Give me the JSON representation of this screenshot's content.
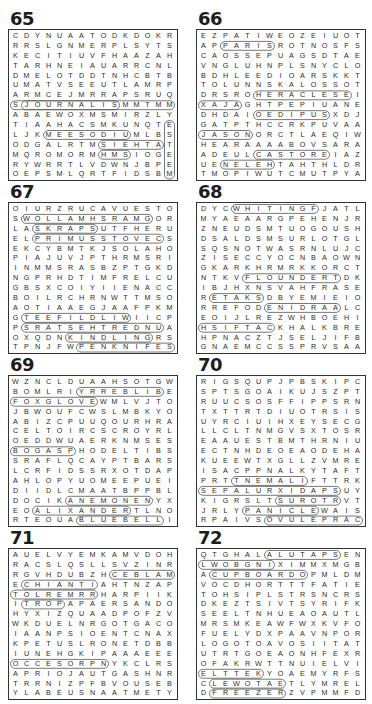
{
  "puzzles": [
    {
      "number": "65",
      "rows": [
        "CDYNUAATODKDOKR",
        "RRSLGNMERPLSYTS",
        "KECITIUVFHAAZAH",
        "TARHNEIAUARRCNL",
        "DMELOTDDTNHCBTB",
        "UMATVSEEUTLAMRP",
        "ARMCEJMRRAPSRUQ",
        "SJOURNALISMMTMM",
        "ABAEWOXMSMIRZLY",
        "TIAAHACSMKUNQTE",
        "LJKMEESODIUMLBS",
        "ODGALRTMSIEHTAT",
        "MQROMORMHMSIOGE",
        "RYWRRTLVDWNJBPE",
        "OEPSMLQRTFIDSBM"
      ],
      "loops": [
        [
          1,
          7,
          9,
          7
        ],
        [
          3,
          10,
          10,
          10
        ],
        [
          8,
          11,
          13,
          11
        ],
        [
          8,
          12,
          10,
          12
        ],
        [
          14,
          9,
          14,
          14
        ],
        [
          0,
          7,
          14,
          7
        ]
      ]
    },
    {
      "number": "66",
      "rows": [
        "EZPATIWEOZEIUOT",
        "APPARISROTNOSFS",
        "CAOSSEPUAGSDTAE",
        "VNGLUHNPLSNYCLO",
        "BDHLEEDIOARSKKT",
        "TOLUNNSKALOSSOT",
        "DRSROHERACLESEI",
        "XAJAGHTPEPIUANE",
        "DHDAIOEDIPUSXDJ",
        "GATPTHCCRKPUVAA",
        "JASONORCTLAEQIW",
        "HEARAAAABOVSARA",
        "ADEULCASTOREIAZ",
        "UENELEHTAHTHLDR",
        "TMOPIWUTCMUTPYA"
      ],
      "loops": [
        [
          2,
          1,
          6,
          1
        ],
        [
          5,
          6,
          13,
          6
        ],
        [
          0,
          7,
          3,
          7
        ],
        [
          5,
          8,
          11,
          8
        ],
        [
          0,
          10,
          4,
          10
        ],
        [
          5,
          12,
          11,
          12
        ],
        [
          2,
          13,
          6,
          13
        ]
      ]
    },
    {
      "number": "67",
      "rows": [
        "OIURZRUCAVUESTO",
        "SWOLLAMHSRAMGOR",
        "LASKRAPSUTFHERU",
        "ELPRIMUSSTOVECS",
        "EKCYBMTKJSOLAHO",
        "PIAJUVJPTHRMSRI",
        "INMMSRASBZPTGKD",
        "NGPRHDTIMFRELCU",
        "GBSXCOIYIIENACC",
        "BOILRCHRNWTTMSO",
        "AOTIAAEGJAAFPKM",
        "GTEEFILDLIWIICP",
        "PSRATSEHTREDNUA",
        "OXQDNKINDLINGRS",
        "TPNJFWPENKNIFES"
      ],
      "loops": [
        [
          1,
          1,
          12,
          1
        ],
        [
          2,
          2,
          7,
          2
        ],
        [
          2,
          3,
          13,
          3
        ],
        [
          1,
          11,
          10,
          11
        ],
        [
          1,
          12,
          13,
          12
        ],
        [
          5,
          13,
          12,
          13
        ],
        [
          6,
          14,
          14,
          14
        ]
      ]
    },
    {
      "number": "68",
      "rows": [
        "DYCWHITINGFJATL",
        "MYAEAARGPEHENJR",
        "ZNEUDSMTUOGOUSH",
        "DSALDSMSURLOTGL",
        "SQSNOTWASRNLUJC",
        "ZISECCYOCNBAOWN",
        "GKARKHRMRKKORCT",
        "NTKVFLOUNDERTDK",
        "IBJHXNSVAHFRASE",
        "RETAKSDBYEMIEIO",
        "RREFODENIDRAALC",
        "EOIJLREZWHBOEHI",
        "HSIFTACKHALKBRE",
        "HPNACZTJSELJIFB",
        "GNAEMCCSSPRVSAA"
      ],
      "loops": [
        [
          3,
          0,
          10,
          0
        ],
        [
          4,
          7,
          12,
          7
        ],
        [
          1,
          9,
          5,
          9
        ],
        [
          6,
          10,
          12,
          10
        ],
        [
          0,
          12,
          6,
          12
        ]
      ]
    },
    {
      "number": "69",
      "rows": [
        "WZNCLDUAAHSOTGW",
        "BOMLRIYRREBLIBE",
        "FOXGLOVEWMLVJTO",
        "JBWOUFCWSLMBKYO",
        "ABIZCPUUQOURHRA",
        "CELTOIRCSCROYRL",
        "OEDDWUAERKNMSES",
        "BOGASPHODELTIBS",
        "SRAFLQCAYPTBARS",
        "LCRFIDSSRXOTDAP",
        "AHLOPYUOMEEPUEI",
        "DIIDLCMAATBPPBL",
        "DOCIKANEMONENYX",
        "EOALIXANDERTLNO",
        "RTEOUABLUEBELLI"
      ],
      "loops": [
        [
          6,
          1,
          13,
          1
        ],
        [
          0,
          2,
          7,
          2
        ],
        [
          0,
          7,
          5,
          7
        ],
        [
          5,
          12,
          12,
          12
        ],
        [
          2,
          13,
          10,
          13
        ],
        [
          6,
          14,
          13,
          14
        ]
      ]
    },
    {
      "number": "70",
      "rows": [
        "RIGSQUPJPBSKIPC",
        "SPTSGOAIKUJSZPT",
        "RUUCSOSFFIPPSRN",
        "TXTTRTDIUOTRSIS",
        "UYRCIUIHXEYSECG",
        "LLCLTNMGVSXTOSR",
        "EAAUESTBMTHRNIU",
        "ECTNHDEOEAODEHA",
        "KUEEWTXGLLZVMRE",
        "ISACPPNALKYTAFT",
        "PRTTNEMALIFTTRK",
        "SEPALURXIDAPSUY",
        "KIGRSLTSUROTRVT",
        "JRLYPANICLEWAIS",
        "RPAIVSOVULEPRAC"
      ],
      "loops": [
        [
          3,
          10,
          9,
          10
        ],
        [
          0,
          11,
          12,
          11
        ],
        [
          7,
          12,
          12,
          12
        ],
        [
          4,
          13,
          10,
          13
        ],
        [
          6,
          14,
          14,
          14
        ]
      ]
    },
    {
      "number": "71",
      "rows": [
        "AUELVYEMKAMVDOH",
        "RACSLQSLLSVZINR",
        "RGVHDUBZHCEBLAM",
        "ECHIANTIAHTNZAP",
        "TOLREMRRHARPIIK",
        "ITROPAPAERSANDO",
        "HYXIZQUAADPOFZV",
        "WKDUELNRGOTGACO",
        "IAANPSIOENTCNAX",
        "KPETUSLRONETDBB",
        "IUNEHGKIPAAAEEE",
        "OCCESORPNYKCLRS",
        "APRIOJAUTGASHNR",
        "TRRNIZPFBVOUSEB",
        "YLABEUSNAATMETY"
      ],
      "loops": [
        [
          9,
          2,
          14,
          2
        ],
        [
          1,
          3,
          7,
          3
        ],
        [
          0,
          4,
          7,
          4
        ],
        [
          1,
          5,
          4,
          5
        ],
        [
          0,
          11,
          8,
          11
        ]
      ]
    },
    {
      "number": "72",
      "rows": [
        "QTGHALALUTAPSEN",
        "LWOBGNIXIMMXMGB",
        "ACUPBOARDOPMLDM",
        "VOCDHORTTTFATIE",
        "TOHSIPLSTRSNCRS",
        "DKEZTSIVTSYRIFK",
        "SEELTNHUEAOAUTL",
        "MRSMKEAWFWXKVFO",
        "FUELYDXPAAVNPOR",
        "LOGOTOAVOSIITAT",
        "UTRTGOEAONHFEXR",
        "OFAKRWTTNUIELVI",
        "ELTTEKYOAEMYRFS",
        "CLEWOTAETLYMREL",
        "DFREEZERZVPMMFD"
      ],
      "loops": [
        [
          6,
          0,
          12,
          0
        ],
        [
          0,
          1,
          6,
          1
        ],
        [
          1,
          2,
          9,
          2
        ],
        [
          0,
          12,
          5,
          12
        ],
        [
          1,
          13,
          7,
          13
        ],
        [
          1,
          14,
          7,
          14
        ]
      ]
    }
  ]
}
